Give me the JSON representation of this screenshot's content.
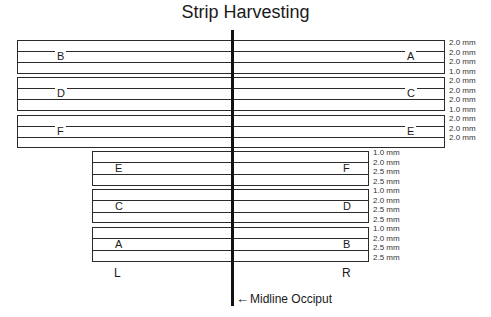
{
  "title": "Strip Harvesting",
  "upper_strips": [
    {
      "left_label": "B",
      "right_label": "A",
      "mm": [
        "2.0 mm",
        "2.0 mm",
        "2.0 mm",
        "1.0 mm"
      ]
    },
    {
      "left_label": "D",
      "right_label": "C",
      "mm": [
        "2.0 mm",
        "2.0 mm",
        "2.0 mm",
        "1.0 mm"
      ]
    },
    {
      "left_label": "F",
      "right_label": "E",
      "mm": [
        "2.0 mm",
        "2.0 mm",
        "2.0 mm"
      ]
    }
  ],
  "lower_strips": [
    {
      "left_label": "E",
      "right_label": "F",
      "mm": [
        "1.0 mm",
        "2.0 mm",
        "2.5 mm",
        "2.5 mm"
      ]
    },
    {
      "left_label": "C",
      "right_label": "D",
      "mm": [
        "1.0 mm",
        "2.0 mm",
        "2.5 mm",
        "2.5 mm"
      ]
    },
    {
      "left_label": "A",
      "right_label": "B",
      "mm": [
        "1.0 mm",
        "2.0 mm",
        "2.5 mm",
        "2.5 mm"
      ]
    }
  ],
  "side_labels": {
    "left": "L",
    "right": "R"
  },
  "midline": {
    "arrow": "←",
    "label": "Midline Occiput"
  }
}
